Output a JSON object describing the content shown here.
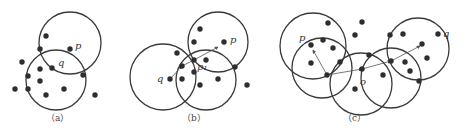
{
  "figure": {
    "panels": [
      {
        "id": "a",
        "caption": "（a）",
        "circles": [
          {
            "cx": 70,
            "cy": 43,
            "r": 31
          },
          {
            "cx": 56,
            "cy": 80,
            "r": 30
          }
        ],
        "points": [
          [
            46,
            36
          ],
          [
            40,
            49
          ],
          [
            70,
            49
          ],
          [
            22,
            62
          ],
          [
            52,
            68
          ],
          [
            40,
            69
          ],
          [
            83,
            75
          ],
          [
            28,
            76
          ],
          [
            40,
            81
          ],
          [
            15,
            89
          ],
          [
            28,
            89
          ],
          [
            64,
            89
          ],
          [
            46,
            95
          ],
          [
            95,
            95
          ]
        ],
        "labels": [
          {
            "text": "p",
            "x": 75,
            "y": 49
          },
          {
            "text": "q",
            "x": 58,
            "y": 66
          }
        ],
        "arrows": []
      },
      {
        "id": "b",
        "caption": "（b）",
        "circles": [
          {
            "cx": 163,
            "cy": 77,
            "r": 33
          },
          {
            "cx": 206,
            "cy": 80,
            "r": 30
          },
          {
            "cx": 218,
            "cy": 42,
            "r": 30
          }
        ],
        "points": [
          [
            200,
            29
          ],
          [
            194,
            42
          ],
          [
            224,
            42
          ],
          [
            177,
            53
          ],
          [
            194,
            60
          ],
          [
            206,
            60
          ],
          [
            182,
            66
          ],
          [
            235,
            67
          ],
          [
            194,
            72
          ],
          [
            170,
            79
          ],
          [
            182,
            79
          ],
          [
            218,
            79
          ],
          [
            200,
            85
          ],
          [
            247,
            85
          ]
        ],
        "labels": [
          {
            "text": "p",
            "x": 230,
            "y": 43
          },
          {
            "text": "q",
            "x": 157,
            "y": 82
          },
          {
            "text": "p₁",
            "x": 197,
            "y": 70
          }
        ],
        "arrows": [
          {
            "x1": 170,
            "y1": 79,
            "x2": 182,
            "y2": 66
          },
          {
            "x1": 182,
            "y1": 66,
            "x2": 194,
            "y2": 60
          },
          {
            "x1": 194,
            "y1": 60,
            "x2": 218,
            "y2": 47
          }
        ]
      },
      {
        "id": "c",
        "caption": "（c）",
        "circles": [
          {
            "cx": 313,
            "cy": 46,
            "r": 33
          },
          {
            "cx": 322,
            "cy": 68,
            "r": 30
          },
          {
            "cx": 361,
            "cy": 84,
            "r": 31
          },
          {
            "cx": 391,
            "cy": 78,
            "r": 30
          },
          {
            "cx": 418,
            "cy": 49,
            "r": 31
          }
        ],
        "points": [
          [
            328,
            23
          ],
          [
            362,
            22
          ],
          [
            355,
            35
          ],
          [
            311,
            45
          ],
          [
            323,
            40
          ],
          [
            333,
            48
          ],
          [
            311,
            63
          ],
          [
            340,
            62
          ],
          [
            327,
            75
          ],
          [
            362,
            69
          ],
          [
            369,
            55
          ],
          [
            383,
            75
          ],
          [
            355,
            89
          ],
          [
            390,
            35
          ],
          [
            403,
            34
          ],
          [
            438,
            34
          ],
          [
            391,
            61
          ],
          [
            422,
            44
          ],
          [
            405,
            62
          ],
          [
            410,
            71
          ],
          [
            427,
            58
          ],
          [
            419,
            81
          ]
        ],
        "labels": [
          {
            "text": "p",
            "x": 299,
            "y": 41
          },
          {
            "text": "q",
            "x": 443,
            "y": 37
          },
          {
            "text": "o",
            "x": 360,
            "y": 85
          }
        ],
        "arrows": [
          {
            "x1": 327,
            "y1": 75,
            "x2": 313,
            "y2": 50
          },
          {
            "x1": 327,
            "y1": 75,
            "x2": 362,
            "y2": 69
          },
          {
            "x1": 362,
            "y1": 69,
            "x2": 391,
            "y2": 61
          },
          {
            "x1": 391,
            "y1": 61,
            "x2": 420,
            "y2": 46
          }
        ]
      }
    ],
    "caption_y": 119,
    "caption_x": [
      60,
      196,
      357
    ]
  }
}
